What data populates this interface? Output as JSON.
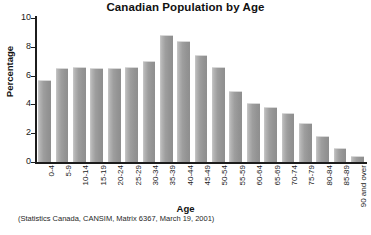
{
  "chart_data": {
    "type": "bar",
    "title": "Canadian Population by Age",
    "xlabel": "Age",
    "ylabel": "Percentage",
    "ylim": [
      0,
      10
    ],
    "yticks": [
      0,
      2,
      4,
      6,
      8,
      10
    ],
    "ytick_labels": [
      "0",
      "2",
      "4",
      "6",
      "8",
      "10"
    ],
    "grid": false,
    "legend": "none",
    "source_note": "(Statistics Canada, CANSIM, Matrix 6367, March 19, 2001)",
    "bar_color": "#9b9b9b",
    "categories": [
      "0-4",
      "5-9",
      "10-14",
      "15-19",
      "20-24",
      "25-29",
      "30-34",
      "35-39",
      "40-44",
      "45-49",
      "50-54",
      "55-59",
      "60-64",
      "65-69",
      "70-74",
      "75-79",
      "80-84",
      "85-89",
      "90 and over"
    ],
    "values": [
      5.7,
      6.5,
      6.6,
      6.5,
      6.5,
      6.6,
      7.0,
      8.8,
      8.4,
      7.4,
      6.6,
      4.9,
      4.1,
      3.8,
      3.4,
      2.7,
      1.8,
      1.0,
      0.4
    ]
  }
}
